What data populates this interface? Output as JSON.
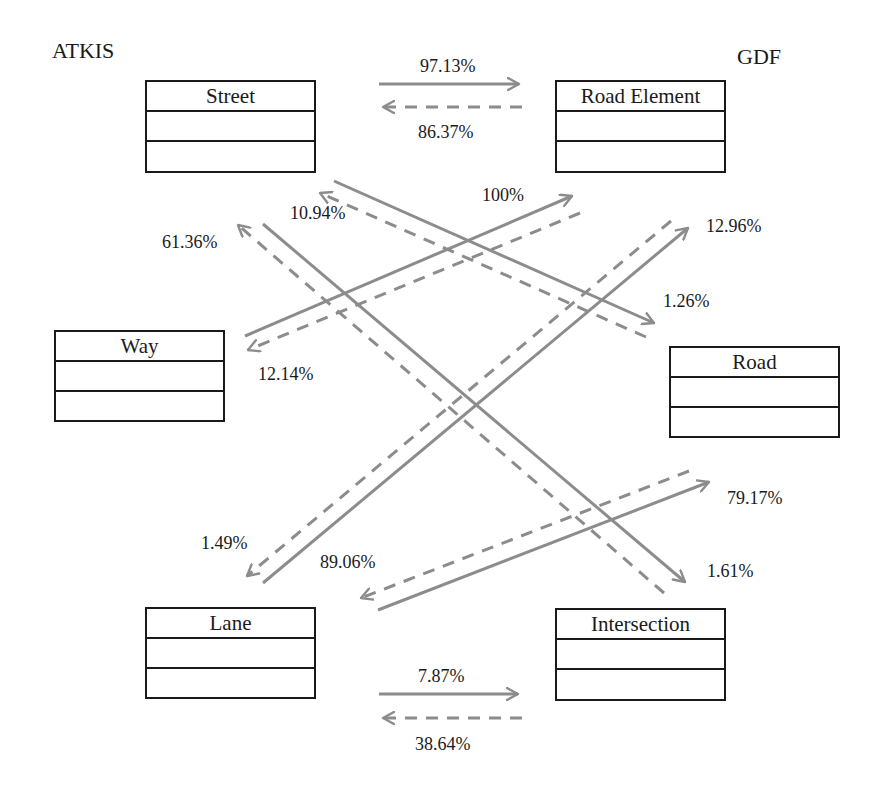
{
  "groups": {
    "left": "ATKIS",
    "right": "GDF"
  },
  "classes": {
    "street": "Street",
    "road_element": "Road Element",
    "way": "Way",
    "road": "Road",
    "lane": "Lane",
    "intersection": "Intersection"
  },
  "colors": {
    "arrow": "#8c8c8c",
    "box_border": "#1a1a1a",
    "text": "#1a1a1a"
  },
  "legend_semantics": {
    "solid": "ATKIS to GDF mapping",
    "dashed": "GDF to ATKIS mapping"
  },
  "mappings": [
    {
      "from": "Street",
      "to": "Road Element",
      "style": "solid",
      "label": "97.13%"
    },
    {
      "from": "Road Element",
      "to": "Street",
      "style": "dashed",
      "label": "86.37%"
    },
    {
      "from": "Street",
      "to": "Road",
      "style": "solid",
      "label": "1.26%"
    },
    {
      "from": "Road",
      "to": "Street",
      "style": "dashed",
      "label": "10.94%"
    },
    {
      "from": "Street",
      "to": "Intersection",
      "style": "solid",
      "label": "1.61%"
    },
    {
      "from": "Intersection",
      "to": "Street",
      "style": "dashed",
      "label": "61.36%"
    },
    {
      "from": "Way",
      "to": "Road Element",
      "style": "solid",
      "label": "100%"
    },
    {
      "from": "Road Element",
      "to": "Way",
      "style": "dashed",
      "label": "12.14%"
    },
    {
      "from": "Lane",
      "to": "Road Element",
      "style": "solid",
      "label": "12.96%"
    },
    {
      "from": "Road Element",
      "to": "Lane",
      "style": "dashed",
      "label": "1.49%"
    },
    {
      "from": "Lane",
      "to": "Road",
      "style": "solid",
      "label": "79.17%"
    },
    {
      "from": "Road",
      "to": "Lane",
      "style": "dashed",
      "label": "89.06%"
    },
    {
      "from": "Lane",
      "to": "Intersection",
      "style": "solid",
      "label": "7.87%"
    },
    {
      "from": "Intersection",
      "to": "Lane",
      "style": "dashed",
      "label": "38.64%"
    }
  ]
}
